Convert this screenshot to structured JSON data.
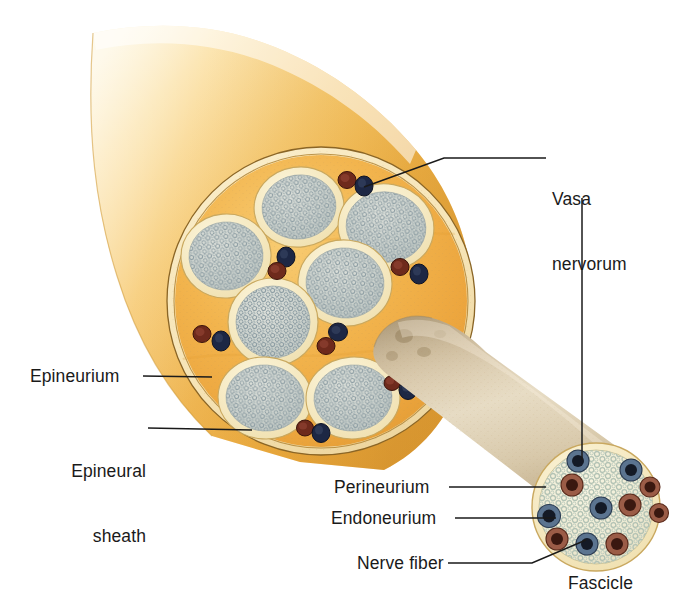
{
  "figure": {
    "background_color": "#ffffff"
  },
  "labels": [
    {
      "id": "vasa-nervorum",
      "text": "Vasa\nnervorum",
      "line1": "Vasa",
      "line2": "nervorum",
      "x": 552,
      "y": 147,
      "align": "left"
    },
    {
      "id": "epineurium",
      "text": "Epineurium",
      "x": 30,
      "y": 367,
      "align": "left"
    },
    {
      "id": "epineural-sheath",
      "text": "Epineural\nsheath",
      "line1": "Epineural",
      "line2": "sheath",
      "x": 31,
      "y": 419,
      "align": "left"
    },
    {
      "id": "perineurium",
      "text": "Perineurium",
      "x": 334,
      "y": 478,
      "align": "left"
    },
    {
      "id": "endoneurium",
      "text": "Endoneurium",
      "x": 331,
      "y": 509,
      "align": "left"
    },
    {
      "id": "nerve-fiber",
      "text": "Nerve fiber",
      "x": 357,
      "y": 555,
      "align": "left"
    },
    {
      "id": "fascicle",
      "text": "Fascicle",
      "x": 570,
      "y": 575,
      "align": "left"
    }
  ],
  "colors": {
    "epineurium_fill": "#efab42",
    "epineurium_fill_light": "#f5c062",
    "epineural_sheath": "#f7e7bb",
    "sheath_outline": "#8d6a2a",
    "perineurium_ring": "#f6edc9",
    "endoneurium_fill": "#cfd3cd",
    "endoneurium_speckle": "#93a3a8",
    "nerve_trunk_gold": "#f2bc55",
    "nerve_trunk_highlight": "#fbe3a8",
    "fascicle_tan": "#cfbb9a",
    "fascicle_tan_light": "#e8dcc4",
    "artery_red": "#6e2a1c",
    "vein_blue": "#1d2744",
    "leader_line": "#1a1a1a",
    "text": "#1a1a1a",
    "distal_endoneurium": "#f3f0d8",
    "distal_speckle": "#b9c6b8"
  },
  "structures": {
    "main_cross_section": {
      "name": "nerve-cross-section",
      "center_x": 321,
      "center_y": 301,
      "radius_x": 154,
      "radius_y": 154,
      "fascicle_count": 7,
      "vessel_pair_count": 6
    },
    "distal_fascicle": {
      "name": "distal-fascicle",
      "center_x": 596,
      "center_y": 507,
      "radius": 64,
      "nerve_fiber_count": 11
    },
    "nerve_trunk": {
      "name": "nerve-trunk-proximal"
    },
    "extracted_fascicle": {
      "name": "extracted-fascicle-cylinder"
    }
  },
  "main_fascicles": [
    {
      "cx": 299,
      "cy": 207,
      "rx": 42,
      "ry": 37,
      "rot": -8
    },
    {
      "cx": 386,
      "cy": 227,
      "rx": 45,
      "ry": 40,
      "rot": 10
    },
    {
      "cx": 226,
      "cy": 256,
      "rx": 42,
      "ry": 39,
      "rot": -5
    },
    {
      "cx": 345,
      "cy": 283,
      "rx": 44,
      "ry": 40,
      "rot": 6
    },
    {
      "cx": 273,
      "cy": 322,
      "rx": 42,
      "ry": 41,
      "rot": 0
    },
    {
      "cx": 265,
      "cy": 398,
      "rx": 44,
      "ry": 38,
      "rot": 4
    },
    {
      "cx": 353,
      "cy": 398,
      "rx": 44,
      "ry": 38,
      "rot": -4
    }
  ],
  "main_vessel_pairs": [
    {
      "ax": 347,
      "ay": 180,
      "bx": 362,
      "by": 185,
      "label": "vasa-nervorum-top"
    },
    {
      "ax": 277,
      "ay": 271,
      "bx": 285,
      "by": 258,
      "label": "vasa-nervorum-center"
    },
    {
      "ax": 400,
      "ay": 267,
      "bx": 419,
      "by": 273,
      "label": "vasa-nervorum-right"
    },
    {
      "ax": 202,
      "ay": 334,
      "bx": 220,
      "by": 340,
      "label": "vasa-nervorum-left"
    },
    {
      "ax": 325,
      "ay": 344,
      "bx": 337,
      "by": 332,
      "label": "vasa-nervorum-mid"
    },
    {
      "ax": 305,
      "ay": 427,
      "bx": 319,
      "by": 431,
      "label": "vasa-nervorum-bottom"
    },
    {
      "ax": 391,
      "ay": 383,
      "bx": 406,
      "by": 389,
      "label": "vasa-nervorum-lower-right"
    }
  ],
  "distal_nerve_fibers": [
    {
      "cx": 578,
      "cy": 461,
      "r": 10,
      "myelin": "vein_blue"
    },
    {
      "cx": 572,
      "cy": 484,
      "r": 11,
      "myelin": "artery_red"
    },
    {
      "cx": 630,
      "cy": 470,
      "r": 10,
      "myelin": "vein_blue"
    },
    {
      "cx": 650,
      "cy": 486,
      "r": 10,
      "myelin": "artery_red"
    },
    {
      "cx": 600,
      "cy": 508,
      "r": 10,
      "myelin": "vein_blue"
    },
    {
      "cx": 629,
      "cy": 504,
      "r": 10,
      "myelin": "artery_red"
    },
    {
      "cx": 548,
      "cy": 515,
      "r": 11,
      "myelin": "vein_blue"
    },
    {
      "cx": 556,
      "cy": 538,
      "r": 10,
      "myelin": "artery_red"
    },
    {
      "cx": 586,
      "cy": 543,
      "r": 10,
      "myelin": "vein_blue"
    },
    {
      "cx": 616,
      "cy": 543,
      "r": 10,
      "myelin": "artery_red"
    },
    {
      "cx": 659,
      "cy": 513,
      "r": 9,
      "myelin": "vein_blue"
    }
  ],
  "leader_lines": [
    {
      "id": "vasa-leader-upper",
      "points": "546,158 442,158 362,188"
    },
    {
      "id": "vasa-leader-vertical",
      "points": "582,196 582,462"
    },
    {
      "id": "epineurium-leader",
      "points": "143,376 210,376"
    },
    {
      "id": "epineural-sheath-leader",
      "points": "146,428 250,428"
    },
    {
      "id": "perineurium-leader",
      "points": "448,487 545,487"
    },
    {
      "id": "endoneurium-leader",
      "points": "452,518 556,518"
    },
    {
      "id": "nerve-fiber-leader",
      "points": "447,563 533,563 586,538"
    }
  ]
}
